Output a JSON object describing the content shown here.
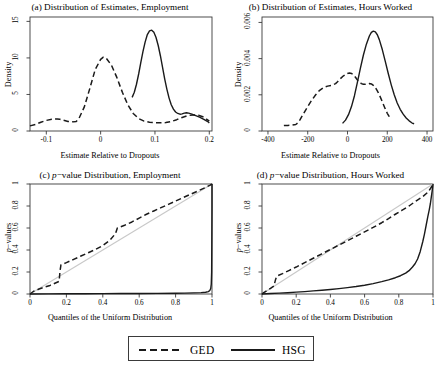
{
  "figure": {
    "width": 441,
    "height": 368,
    "background": "#ffffff",
    "line_color": "#1a1a1a",
    "reference_line_color": "#c8c8c8",
    "frame_color": "#3a3a3a"
  },
  "legend": {
    "name": "figure-legend",
    "entries": [
      {
        "label": "GED",
        "style": "dashed"
      },
      {
        "label": "HSG",
        "style": "solid"
      }
    ]
  },
  "panels": {
    "a": {
      "title_prefix": "(a) Distribution of Estimates, Employment",
      "xlabel": "Estimate Relative to Dropouts",
      "ylabel": "Density",
      "xticks": [
        "-0.1",
        "0",
        "0.1",
        "0.2"
      ],
      "yticks": [
        "0",
        "5",
        "10",
        "15"
      ]
    },
    "b": {
      "title_prefix": "(b) Distribution of Estimates, Hours Worked",
      "xlabel": "Estimate Relative to Dropouts",
      "ylabel": "Density",
      "xticks": [
        "-400",
        "-200",
        "0",
        "200",
        "400"
      ],
      "yticks": [
        "0",
        "0.002",
        "0.004",
        "0.006"
      ]
    },
    "c": {
      "title_a": "(c) ",
      "title_p": "p",
      "title_b": "−value Distribution, Employment",
      "xlabel": "Quantiles of the Uniform Distribution",
      "ylabel_p": "p",
      "ylabel_rest": "−values",
      "xticks": [
        "0",
        "0.2",
        "0.4",
        "0.6",
        "0.8",
        "1"
      ],
      "yticks": [
        "0",
        "0.2",
        "0.4",
        "0.6",
        "0.8",
        "1"
      ]
    },
    "d": {
      "title_a": "(d) ",
      "title_p": "p",
      "title_b": "−value Distribution, Hours Worked",
      "xlabel": "Quantiles of the Uniform Distribution",
      "ylabel_p": "p",
      "ylabel_rest": "−values",
      "xticks": [
        "0",
        "0.2",
        "0.4",
        "0.6",
        "0.8",
        "1"
      ],
      "yticks": [
        "0",
        "0.2",
        "0.4",
        "0.6",
        "0.8",
        "1"
      ]
    }
  },
  "chart_data": [
    {
      "id": "panel-a",
      "type": "line",
      "title": "(a) Distribution of Estimates, Employment",
      "xlabel": "Estimate Relative to Dropouts",
      "ylabel": "Density",
      "xlim": [
        -0.13,
        0.205
      ],
      "ylim": [
        0,
        15.6
      ],
      "xticks": [
        -0.1,
        0,
        0.1,
        0.2
      ],
      "yticks": [
        0,
        5,
        10,
        15
      ],
      "grid": false,
      "legend_position": "below-figure",
      "series": [
        {
          "name": "GED",
          "style": "dashed",
          "x": [
            -0.13,
            -0.12,
            -0.11,
            -0.1,
            -0.09,
            -0.08,
            -0.075,
            -0.07,
            -0.06,
            -0.05,
            -0.045,
            -0.04,
            -0.03,
            -0.02,
            -0.01,
            0.0,
            0.005,
            0.01,
            0.02,
            0.03,
            0.04,
            0.05,
            0.06,
            0.07,
            0.08,
            0.09,
            0.1,
            0.11,
            0.12,
            0.13,
            0.14,
            0.15,
            0.16,
            0.17,
            0.18,
            0.19,
            0.2
          ],
          "y": [
            0.7,
            0.9,
            1.2,
            1.45,
            1.6,
            1.65,
            1.6,
            1.5,
            1.3,
            1.25,
            1.3,
            1.7,
            3.3,
            5.8,
            8.4,
            9.8,
            10.1,
            10.0,
            9.0,
            7.3,
            5.3,
            3.6,
            2.4,
            1.7,
            1.35,
            1.2,
            1.15,
            1.12,
            1.15,
            1.3,
            1.55,
            1.85,
            2.1,
            2.2,
            2.15,
            1.9,
            1.35
          ]
        },
        {
          "name": "HSG",
          "style": "solid",
          "x": [
            0.058,
            0.062,
            0.066,
            0.07,
            0.074,
            0.078,
            0.082,
            0.086,
            0.09,
            0.094,
            0.098,
            0.102,
            0.106,
            0.11,
            0.114,
            0.118,
            0.122,
            0.126,
            0.13,
            0.134,
            0.138,
            0.142,
            0.146,
            0.15,
            0.154,
            0.158,
            0.162,
            0.168,
            0.175,
            0.182,
            0.19,
            0.198,
            0.2
          ],
          "y": [
            4.6,
            5.3,
            6.4,
            7.8,
            9.4,
            10.9,
            12.2,
            13.2,
            13.7,
            13.8,
            13.5,
            12.8,
            11.7,
            10.3,
            8.7,
            7.1,
            5.7,
            4.5,
            3.6,
            3.0,
            2.6,
            2.4,
            2.3,
            2.35,
            2.45,
            2.5,
            2.45,
            2.3,
            2.1,
            1.9,
            1.6,
            1.25,
            1.1
          ]
        }
      ]
    },
    {
      "id": "panel-b",
      "type": "line",
      "title": "(b) Distribution of Estimates, Hours Worked",
      "xlabel": "Estimate Relative to Dropouts",
      "ylabel": "Density",
      "xlim": [
        -430,
        430
      ],
      "ylim": [
        0,
        0.0063
      ],
      "xticks": [
        -400,
        -200,
        0,
        200,
        400
      ],
      "yticks": [
        0,
        0.002,
        0.004,
        0.006
      ],
      "grid": false,
      "legend_position": "below-figure",
      "series": [
        {
          "name": "GED",
          "style": "dashed",
          "x": [
            -320,
            -300,
            -280,
            -260,
            -250,
            -240,
            -230,
            -220,
            -200,
            -180,
            -160,
            -140,
            -120,
            -100,
            -80,
            -60,
            -50,
            -40,
            -20,
            0,
            10,
            20,
            30,
            40,
            50,
            60,
            70,
            80,
            90,
            100,
            110,
            120,
            130,
            140,
            150,
            160,
            170,
            180,
            190,
            200,
            210,
            215
          ],
          "y": [
            0.0003,
            0.00031,
            0.00032,
            0.00036,
            0.00045,
            0.0006,
            0.0008,
            0.00098,
            0.00135,
            0.0017,
            0.002,
            0.00225,
            0.0024,
            0.00248,
            0.00252,
            0.00262,
            0.00272,
            0.00285,
            0.00305,
            0.00318,
            0.0032,
            0.00318,
            0.0031,
            0.00297,
            0.00282,
            0.0027,
            0.00262,
            0.00258,
            0.00258,
            0.0026,
            0.00262,
            0.0026,
            0.00252,
            0.0024,
            0.00222,
            0.002,
            0.00175,
            0.00148,
            0.00122,
            0.00098,
            0.0008,
            0.00072
          ]
        },
        {
          "name": "HSG",
          "style": "solid",
          "x": [
            -25,
            -10,
            5,
            20,
            35,
            50,
            65,
            80,
            95,
            110,
            120,
            130,
            140,
            150,
            160,
            175,
            190,
            205,
            220,
            235,
            250,
            265,
            280,
            295,
            310,
            325,
            335
          ],
          "y": [
            0.00042,
            0.0006,
            0.0009,
            0.00135,
            0.00195,
            0.0027,
            0.00348,
            0.0042,
            0.0048,
            0.00525,
            0.00545,
            0.00552,
            0.00548,
            0.00532,
            0.00505,
            0.0045,
            0.00385,
            0.00318,
            0.00255,
            0.002,
            0.00155,
            0.0012,
            0.00093,
            0.00072,
            0.00056,
            0.00044,
            0.0004
          ]
        }
      ]
    },
    {
      "id": "panel-c",
      "type": "line",
      "title": "(c) p-value Distribution, Employment",
      "xlabel": "Quantiles of the Uniform Distribution",
      "ylabel": "p-values",
      "xlim": [
        0,
        1
      ],
      "ylim": [
        0,
        1
      ],
      "xticks": [
        0,
        0.2,
        0.4,
        0.6,
        0.8,
        1
      ],
      "yticks": [
        0,
        0.2,
        0.4,
        0.6,
        0.8,
        1
      ],
      "grid": false,
      "legend_position": "below-figure",
      "reference_line": {
        "name": "45-degree",
        "from": [
          0,
          0
        ],
        "to": [
          1,
          1
        ],
        "color": "#c8c8c8"
      },
      "series": [
        {
          "name": "GED",
          "style": "dashed",
          "x": [
            0.0,
            0.02,
            0.05,
            0.08,
            0.11,
            0.14,
            0.16,
            0.165,
            0.17,
            0.2,
            0.24,
            0.28,
            0.32,
            0.36,
            0.4,
            0.44,
            0.47,
            0.48,
            0.52,
            0.56,
            0.6,
            0.64,
            0.68,
            0.72,
            0.76,
            0.8,
            0.84,
            0.88,
            0.92,
            0.96,
            0.99,
            1.0
          ],
          "y": [
            0.0,
            0.025,
            0.045,
            0.062,
            0.078,
            0.1,
            0.115,
            0.21,
            0.265,
            0.285,
            0.315,
            0.345,
            0.375,
            0.405,
            0.44,
            0.49,
            0.55,
            0.6,
            0.625,
            0.655,
            0.69,
            0.725,
            0.755,
            0.785,
            0.815,
            0.845,
            0.875,
            0.905,
            0.935,
            0.965,
            0.99,
            1.0
          ]
        },
        {
          "name": "HSG",
          "style": "solid",
          "x": [
            0.0,
            0.1,
            0.2,
            0.3,
            0.4,
            0.5,
            0.6,
            0.7,
            0.8,
            0.85,
            0.9,
            0.94,
            0.965,
            0.98,
            0.988,
            0.993,
            0.996,
            0.998,
            0.999,
            1.0,
            1.0
          ],
          "y": [
            0.0,
            0.0015,
            0.0022,
            0.0028,
            0.0034,
            0.004,
            0.0048,
            0.0058,
            0.0072,
            0.0082,
            0.0098,
            0.0122,
            0.0155,
            0.022,
            0.032,
            0.05,
            0.09,
            0.2,
            0.45,
            0.78,
            1.0
          ]
        }
      ]
    },
    {
      "id": "panel-d",
      "type": "line",
      "title": "(d) p-value Distribution, Hours Worked",
      "xlabel": "Quantiles of the Uniform Distribution",
      "ylabel": "p-values",
      "xlim": [
        0,
        1
      ],
      "ylim": [
        0,
        1
      ],
      "xticks": [
        0,
        0.2,
        0.4,
        0.6,
        0.8,
        1
      ],
      "yticks": [
        0,
        0.2,
        0.4,
        0.6,
        0.8,
        1
      ],
      "grid": false,
      "legend_position": "below-figure",
      "reference_line": {
        "name": "45-degree",
        "from": [
          0,
          0
        ],
        "to": [
          1,
          1
        ],
        "color": "#c8c8c8"
      },
      "series": [
        {
          "name": "GED",
          "style": "dashed",
          "x": [
            0.0,
            0.01,
            0.02,
            0.03,
            0.04,
            0.05,
            0.06,
            0.07,
            0.075,
            0.08,
            0.085,
            0.09,
            0.12,
            0.16,
            0.2,
            0.25,
            0.3,
            0.35,
            0.4,
            0.45,
            0.5,
            0.55,
            0.6,
            0.65,
            0.7,
            0.74,
            0.78,
            0.82,
            0.86,
            0.9,
            0.94,
            0.97,
            0.99,
            1.0
          ],
          "y": [
            0.0,
            0.012,
            0.022,
            0.032,
            0.042,
            0.052,
            0.062,
            0.072,
            0.105,
            0.135,
            0.155,
            0.165,
            0.185,
            0.215,
            0.245,
            0.285,
            0.325,
            0.365,
            0.405,
            0.445,
            0.485,
            0.525,
            0.565,
            0.605,
            0.648,
            0.685,
            0.725,
            0.762,
            0.8,
            0.845,
            0.885,
            0.925,
            0.97,
            1.0
          ]
        },
        {
          "name": "HSG",
          "style": "solid",
          "x": [
            0.0,
            0.05,
            0.1,
            0.15,
            0.2,
            0.25,
            0.3,
            0.35,
            0.4,
            0.45,
            0.5,
            0.55,
            0.6,
            0.65,
            0.7,
            0.74,
            0.78,
            0.81,
            0.84,
            0.86,
            0.88,
            0.895,
            0.91,
            0.925,
            0.94,
            0.95,
            0.96,
            0.97,
            0.978,
            0.985,
            0.99,
            0.995,
            1.0
          ],
          "y": [
            0.0,
            0.004,
            0.008,
            0.012,
            0.017,
            0.022,
            0.028,
            0.034,
            0.041,
            0.049,
            0.058,
            0.068,
            0.08,
            0.094,
            0.112,
            0.128,
            0.148,
            0.166,
            0.19,
            0.212,
            0.245,
            0.275,
            0.318,
            0.385,
            0.475,
            0.545,
            0.625,
            0.705,
            0.765,
            0.825,
            0.88,
            0.935,
            1.0
          ]
        }
      ]
    }
  ]
}
